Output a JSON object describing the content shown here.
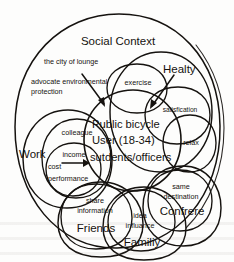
{
  "diagram": {
    "title": "Social Context",
    "center": {
      "line1": "Public bicycle",
      "line2": "User (18-34)",
      "line3": "sutdents/officers"
    },
    "clusters": [
      {
        "id": "healty",
        "label": "Healty"
      },
      {
        "id": "work",
        "label": "Work"
      },
      {
        "id": "confrere",
        "label": "Confrere"
      },
      {
        "id": "friends",
        "label": "Friends"
      },
      {
        "id": "familiy",
        "label": "Familiy"
      }
    ],
    "annotations": [
      {
        "id": "city-of-lounge",
        "line1": "the city of lounge",
        "line2": ""
      },
      {
        "id": "advocate-environmental",
        "line1": "advocate environmental",
        "line2": "protection"
      },
      {
        "id": "exercise",
        "line1": "exercise",
        "line2": ""
      },
      {
        "id": "satisfication",
        "line1": "satisfication",
        "line2": ""
      },
      {
        "id": "relax",
        "line1": "relax",
        "line2": ""
      },
      {
        "id": "same-destination",
        "line1": "same",
        "line2": "destination"
      },
      {
        "id": "idea-influance",
        "line1": "idea",
        "line2": "influance"
      },
      {
        "id": "share-information",
        "line1": "share",
        "line2": "information"
      },
      {
        "id": "colleague",
        "line1": "colleague",
        "line2": ""
      },
      {
        "id": "income",
        "line1": "income",
        "line2": ""
      },
      {
        "id": "cost-performance",
        "line1": "cost",
        "line2": "performance"
      }
    ],
    "colors": {
      "ink": "#15120f",
      "paper": "#fdfdfc"
    }
  }
}
